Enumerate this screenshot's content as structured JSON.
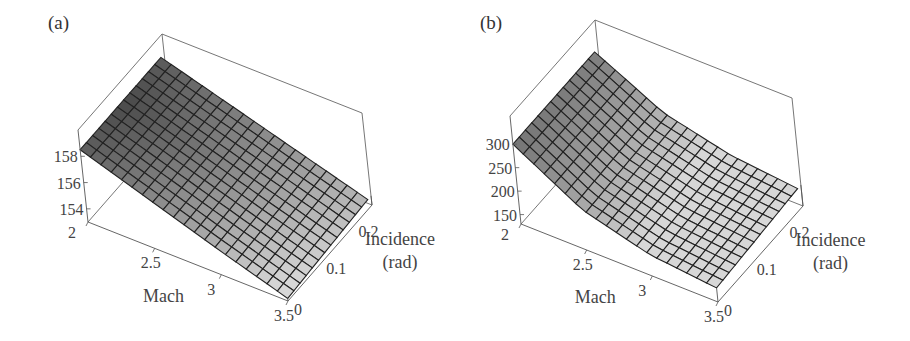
{
  "panels": [
    {
      "id": "a",
      "label": "(a)"
    },
    {
      "id": "b",
      "label": "(b)"
    }
  ],
  "chart_data": [
    {
      "type": "surface",
      "panel": "(a)",
      "xlabel": "Mach",
      "ylabel": "Incidence (rad)",
      "ylabel_lines": [
        "Incidence",
        "(rad)"
      ],
      "zlabel": "",
      "x_ticks": [
        "2",
        "2.5",
        "3",
        "3.5"
      ],
      "y_ticks": [
        "0",
        "0.1",
        "0.2"
      ],
      "z_ticks": [
        "154",
        "156",
        "158"
      ],
      "x_range": [
        2,
        3.5
      ],
      "y_range": [
        0,
        0.26
      ],
      "z_range": [
        153,
        160
      ],
      "grid": {
        "mach_lines": 20,
        "incidence_lines": 13
      },
      "sample_values": {
        "mach": [
          2,
          2.5,
          3,
          3.5
        ],
        "incidence_0": [
          158.5,
          156.7,
          154.9,
          153.2
        ],
        "incidence_0.25": [
          158.5,
          156.9,
          155.3,
          153.7
        ]
      }
    },
    {
      "type": "surface",
      "panel": "(b)",
      "xlabel": "Mach",
      "ylabel": "Incidence (rad)",
      "ylabel_lines": [
        "Incidence",
        "(rad)"
      ],
      "zlabel": "",
      "x_ticks": [
        "2",
        "2.5",
        "3",
        "3.5"
      ],
      "y_ticks": [
        "0",
        "0.1",
        "0.2"
      ],
      "z_ticks": [
        "150",
        "200",
        "250",
        "300"
      ],
      "x_range": [
        2,
        3.5
      ],
      "y_range": [
        0,
        0.26
      ],
      "z_range": [
        130,
        360
      ],
      "grid": {
        "mach_lines": 20,
        "incidence_lines": 13
      },
      "sample_values": {
        "mach": [
          2,
          2.5,
          3,
          3.5
        ],
        "incidence_0": [
          300,
          215,
          175,
          160
        ],
        "incidence_0.25": [
          300,
          225,
          190,
          175
        ]
      }
    }
  ]
}
